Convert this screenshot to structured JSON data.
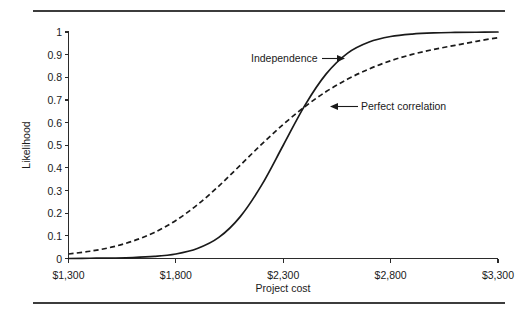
{
  "figure": {
    "background_color": "#ffffff",
    "rule_color": "#3c3c3c",
    "axis_color": "#2b2b2b",
    "ink_color": "#1a1a1a"
  },
  "chart_data": {
    "type": "line",
    "title": "",
    "xlabel": "Project cost",
    "ylabel": "Likelihood",
    "xlim": [
      1300,
      3300
    ],
    "ylim": [
      0,
      1
    ],
    "grid": false,
    "legend": "inline-annotations",
    "xtick_labels": [
      "$1,300",
      "$1,800",
      "$2,300",
      "$2,800",
      "$3,300"
    ],
    "xtick_values": [
      1300,
      1800,
      2300,
      2800,
      3300
    ],
    "ytick_labels": [
      "0",
      "0.1",
      "0.2",
      "0.3",
      "0.4",
      "0.5",
      "0.6",
      "0.7",
      "0.8",
      "0.9",
      "1"
    ],
    "ytick_values": [
      0,
      0.1,
      0.2,
      0.3,
      0.4,
      0.5,
      0.6,
      0.7,
      0.8,
      0.9,
      1
    ],
    "annotations": [
      {
        "label": "Independence",
        "arrow": "right",
        "points_to_series": "Independence",
        "target_x": 2460,
        "target_y": 0.885
      },
      {
        "label": "Perfect correlation",
        "arrow": "left",
        "points_to_series": "Perfect correlation",
        "target_x": 2400,
        "target_y": 0.672
      }
    ],
    "x": [
      1300,
      1400,
      1500,
      1600,
      1700,
      1800,
      1900,
      2000,
      2100,
      2200,
      2300,
      2400,
      2500,
      2600,
      2700,
      2800,
      2900,
      3000,
      3100,
      3200,
      3300
    ],
    "series": [
      {
        "name": "Independence",
        "style": "solid",
        "color": "#1a1a1a",
        "values": [
          0.0,
          0.001,
          0.002,
          0.004,
          0.009,
          0.02,
          0.044,
          0.093,
          0.185,
          0.325,
          0.5,
          0.675,
          0.815,
          0.907,
          0.956,
          0.98,
          0.991,
          0.996,
          0.998,
          0.999,
          1.0
        ]
      },
      {
        "name": "Perfect correlation",
        "style": "dashed",
        "color": "#1a1a1a",
        "values": [
          0.02,
          0.032,
          0.05,
          0.077,
          0.115,
          0.168,
          0.237,
          0.32,
          0.412,
          0.505,
          0.592,
          0.67,
          0.737,
          0.792,
          0.837,
          0.873,
          0.901,
          0.923,
          0.941,
          0.959,
          0.975
        ]
      }
    ]
  }
}
